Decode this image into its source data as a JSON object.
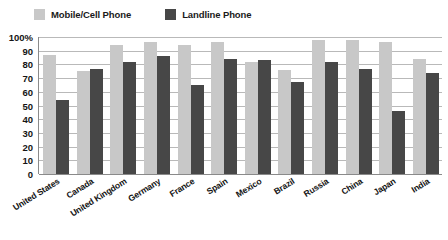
{
  "chart_data": {
    "type": "bar",
    "title": "",
    "subtitle": "",
    "xlabel": "",
    "ylabel": "",
    "ylim": [
      0,
      100
    ],
    "ytick_labels": [
      "100%",
      "90",
      "80",
      "70",
      "60",
      "50",
      "40",
      "30",
      "20",
      "10",
      "0"
    ],
    "ytick_values": [
      100,
      90,
      80,
      70,
      60,
      50,
      40,
      30,
      20,
      10,
      0
    ],
    "grid": true,
    "legend_position": "top-left",
    "categories": [
      "United States",
      "Canada",
      "United Kingdom",
      "Germany",
      "France",
      "Spain",
      "Mexico",
      "Brazil",
      "Russia",
      "China",
      "Japan",
      "India"
    ],
    "series": [
      {
        "name": "Mobile/Cell Phone",
        "color": "#c8c8c8",
        "values": [
          87,
          75,
          94,
          96,
          94,
          96,
          82,
          76,
          98,
          98,
          96,
          84
        ]
      },
      {
        "name": "Landline Phone",
        "color": "#474747",
        "values": [
          54,
          77,
          82,
          86,
          65,
          84,
          83,
          67,
          82,
          77,
          46,
          74
        ]
      }
    ]
  },
  "legend": {
    "items": [
      {
        "label": "Mobile/Cell Phone",
        "color": "#c8c8c8",
        "swatch_name": "legend-swatch-mobile"
      },
      {
        "label": "Landline Phone",
        "color": "#474747",
        "swatch_name": "legend-swatch-landline"
      }
    ]
  }
}
